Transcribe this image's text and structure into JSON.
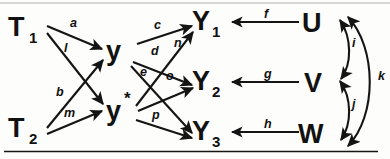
{
  "figure": {
    "kind": "path-diagram",
    "background_color": "#fdfdfb",
    "ink_color": "#141414"
  },
  "nodes": {
    "t1": {
      "main": "T",
      "sub": "1",
      "x": 22,
      "y": 36
    },
    "t2": {
      "main": "T",
      "sub": "2",
      "x": 22,
      "y": 137
    },
    "y": {
      "main": "y",
      "sub": "",
      "x": 118,
      "y": 55
    },
    "ystar": {
      "main": "y",
      "sub": "",
      "star": "*",
      "x": 118,
      "y": 117
    },
    "y1": {
      "main": "Y",
      "sub": "1",
      "x": 205,
      "y": 30
    },
    "y2": {
      "main": "Y",
      "sub": "2",
      "x": 205,
      "y": 89
    },
    "y3": {
      "main": "Y",
      "sub": "3",
      "x": 205,
      "y": 140
    },
    "u": {
      "main": "U",
      "sub": "",
      "x": 318,
      "y": 32
    },
    "v": {
      "main": "V",
      "sub": "",
      "x": 318,
      "y": 91
    },
    "w": {
      "main": "W",
      "sub": "",
      "x": 318,
      "y": 142
    }
  },
  "edges": [
    {
      "id": "a",
      "label": "a",
      "from": "t1",
      "to": "y",
      "label_x": 70,
      "label_y": 27
    },
    {
      "id": "l",
      "label": "l",
      "from": "t1",
      "to": "ystar",
      "label_x": 64,
      "label_y": 52
    },
    {
      "id": "b",
      "label": "b",
      "from": "t2",
      "to": "y",
      "label_x": 56,
      "label_y": 96
    },
    {
      "id": "m",
      "label": "m",
      "from": "t2",
      "to": "ystar",
      "label_x": 64,
      "label_y": 117
    },
    {
      "id": "c",
      "label": "c",
      "from": "y",
      "to": "y1",
      "label_x": 154,
      "label_y": 29
    },
    {
      "id": "d",
      "label": "d",
      "from": "y",
      "to": "y2",
      "label_x": 151,
      "label_y": 55
    },
    {
      "id": "e",
      "label": "e",
      "from": "y",
      "to": "y3",
      "label_x": 140,
      "label_y": 76
    },
    {
      "id": "n",
      "label": "n",
      "from": "ystar",
      "to": "y1",
      "label_x": 174,
      "label_y": 47
    },
    {
      "id": "o",
      "label": "o",
      "from": "ystar",
      "to": "y2",
      "label_x": 166,
      "label_y": 80
    },
    {
      "id": "p",
      "label": "p",
      "from": "ystar",
      "to": "y3",
      "label_x": 152,
      "label_y": 119
    },
    {
      "id": "f",
      "label": "f",
      "from": "u",
      "to": "y1",
      "label_x": 264,
      "label_y": 18
    },
    {
      "id": "g",
      "label": "g",
      "from": "v",
      "to": "y2",
      "label_x": 264,
      "label_y": 78
    },
    {
      "id": "h",
      "label": "h",
      "from": "w",
      "to": "y3",
      "label_x": 264,
      "label_y": 128
    },
    {
      "id": "i",
      "label": "i",
      "from": "u",
      "to": "v",
      "bidirectional": true,
      "label_x": 352,
      "label_y": 47
    },
    {
      "id": "j",
      "label": "j",
      "from": "v",
      "to": "w",
      "bidirectional": true,
      "label_x": 352,
      "label_y": 108
    },
    {
      "id": "k",
      "label": "k",
      "from": "w",
      "to": "u",
      "bidirectional": true,
      "label_x": 378,
      "label_y": 80
    }
  ],
  "rules": {
    "bottom_rule": "horizontal-rule",
    "top_rule": "horizontal-rule-faint"
  }
}
